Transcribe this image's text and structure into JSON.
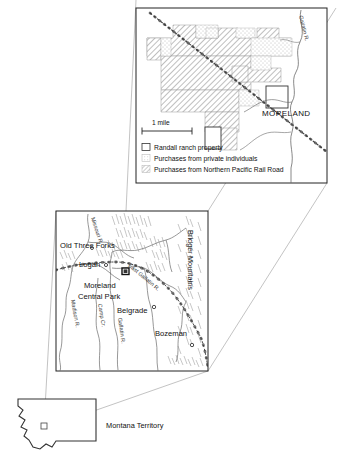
{
  "figure": {
    "caption_none": "",
    "panels": [
      "detail-inset",
      "county-map",
      "territory-map"
    ]
  },
  "colors": {
    "frame": "#222222",
    "ink": "#111111",
    "river": "#555555",
    "railroad": "#333333",
    "hatch": "#777777",
    "stipple": "#999999",
    "connector": "#888888",
    "paper": "#ffffff"
  },
  "detail_inset": {
    "place_label": "MORELAND",
    "river_label": "Gallatin R.",
    "scale": {
      "label": "1 mile"
    },
    "legend": {
      "items": [
        {
          "key": "ranch",
          "label": "Randall ranch property",
          "swatch": "outline-square"
        },
        {
          "key": "private",
          "label": "Purchases from private individuals",
          "swatch": "stipple"
        },
        {
          "key": "npr",
          "label": "Purchases from Northern Pacific Rail Road",
          "swatch": "hatch"
        }
      ]
    }
  },
  "county_map": {
    "towns": [
      {
        "name": "Old Three Forks"
      },
      {
        "name": "Logan"
      },
      {
        "name": "Moreland"
      },
      {
        "name": "Central Park"
      },
      {
        "name": "Belgrade"
      },
      {
        "name": "Bozeman"
      }
    ],
    "rivers": [
      {
        "name": "Missouri R."
      },
      {
        "name": "Madison R."
      },
      {
        "name": "Camp Cr."
      },
      {
        "name": "Gallatin R."
      },
      {
        "name": "East Gallatin R."
      }
    ],
    "ranges": [
      {
        "name": "Bridger Mountains"
      }
    ]
  },
  "territory_map": {
    "label": "Montana Territory",
    "marker": "study-area-square"
  }
}
